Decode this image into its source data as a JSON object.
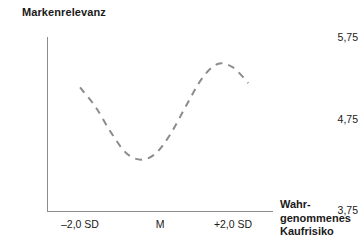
{
  "chart_data": {
    "type": "line",
    "title": "",
    "ylabel": "Markenrelevanz",
    "xlabel": "Wahrgenommenes Kaufrisiko",
    "xlabel_lines": [
      "Wahr-",
      "genommenes",
      "Kaufrisiko"
    ],
    "grid": false,
    "legend": "none",
    "ylim": [
      3.75,
      5.75
    ],
    "yticks": [
      "5,75",
      "4,75",
      "3,75"
    ],
    "ytick_values": [
      5.75,
      4.75,
      3.75
    ],
    "xticks": [
      "–2,0 SD",
      "M",
      "+2,0 SD"
    ],
    "xtick_values": [
      -2.0,
      0.0,
      2.0
    ],
    "series": [
      {
        "name": "Markenrelevanz",
        "style": "dashed",
        "color": "#8c8c8c",
        "x": [
          -2.0,
          -1.6,
          -1.2,
          -0.8,
          -0.4,
          0.0,
          0.4,
          0.8,
          1.2,
          1.6,
          2.0,
          2.4
        ],
        "values": [
          5.17,
          4.95,
          4.66,
          4.42,
          4.34,
          4.42,
          4.66,
          4.98,
          5.28,
          5.44,
          5.4,
          5.22
        ]
      }
    ],
    "annotations": {
      "shape": "cubic-trend: falls to minimum near –0,4 SD, rises to maximum near +1,6 SD, then declines"
    }
  },
  "colors": {
    "axis": "#8c8c8c",
    "curve": "#8c8c8c",
    "text": "#1a1a1a",
    "background": "#ffffff"
  }
}
